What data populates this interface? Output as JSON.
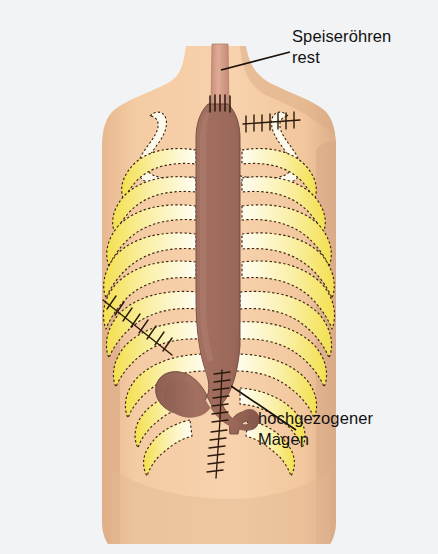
{
  "figure": {
    "kind": "medical-illustration",
    "language": "de",
    "background_color": "#f2f3f5"
  },
  "labels": {
    "esophagus_remnant": {
      "line1": "Speiseröhren",
      "line2": "rest",
      "name": "esophageal-remnant-label"
    },
    "pulled_up_stomach": {
      "line1": "hochgezogener",
      "line2": "Magen",
      "name": "pulled-up-stomach-label"
    }
  },
  "anatomy": {
    "torso": {
      "label": "torso",
      "color": "#f4cba3",
      "shadow_color": "#dcae8b"
    },
    "clavicle_left": {
      "label": "left clavicle",
      "color": "#fdfaec"
    },
    "clavicle_right": {
      "label": "right clavicle",
      "color": "#fdfaec"
    },
    "ribs_left": {
      "label": "left ribs",
      "count": 10,
      "color_outer": "#f5e55a",
      "color_inner": "#fffdf0"
    },
    "ribs_right": {
      "label": "right ribs",
      "count": 10,
      "color_outer": "#f5e55a",
      "color_inner": "#fffdf0"
    },
    "stomach_conduit": {
      "label": "pulled-up gastric conduit",
      "color": "#9c6a5c"
    },
    "esophagus_stump": {
      "label": "esophageal remnant tube",
      "color": "#d79b86"
    },
    "outline_color": "#3a2410"
  },
  "sutures": [
    {
      "name": "cervical-anastomosis-suture",
      "label": "anastomosis sutures at neck"
    },
    {
      "name": "right-thoracotomy-suture",
      "label": "upper right chest suture row"
    },
    {
      "name": "left-flank-suture",
      "label": "left costal margin suture row"
    },
    {
      "name": "abdominal-midline-suture",
      "label": "vertical abdominal suture line"
    }
  ],
  "leader_lines": [
    {
      "name": "leader-line-esophagus"
    },
    {
      "name": "leader-line-stomach"
    }
  ]
}
